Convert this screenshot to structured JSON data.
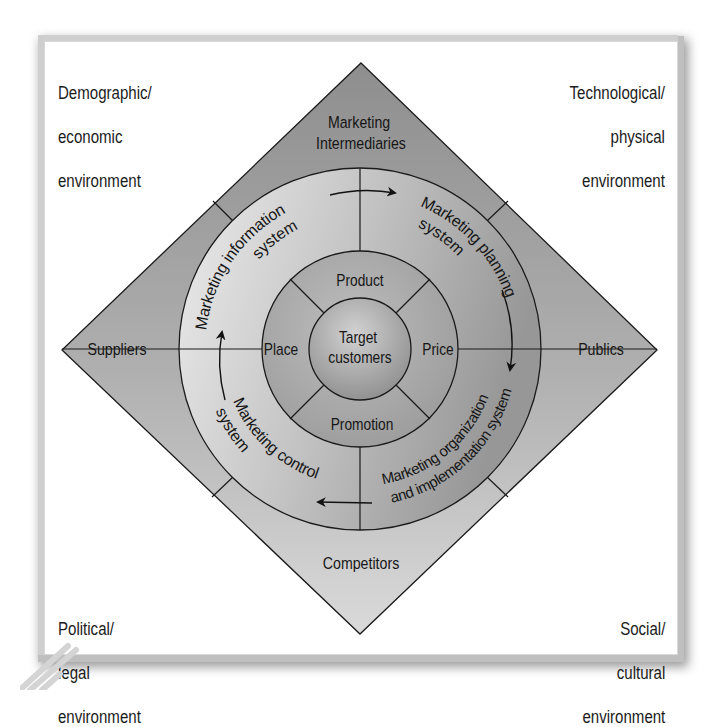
{
  "environments": {
    "top_left": [
      "Demographic/",
      "economic",
      "environment"
    ],
    "top_right": [
      "Technological/",
      "physical",
      "environment"
    ],
    "bottom_left": [
      "Political/",
      "legal",
      "environment"
    ],
    "bottom_right": [
      "Social/",
      "cultural",
      "environment"
    ]
  },
  "actors": {
    "top": [
      "Marketing",
      "Intermediaries"
    ],
    "left": "Suppliers",
    "right": "Publics",
    "bottom": "Competitors"
  },
  "systems": {
    "top_left": [
      "Marketing information",
      "system"
    ],
    "top_right": [
      "Marketing planning",
      "system"
    ],
    "bottom_right": [
      "Marketing organization",
      "and implementation system"
    ],
    "bottom_left": [
      "Marketing control",
      "system"
    ]
  },
  "marketing_mix": {
    "top": "Product",
    "right": "Price",
    "bottom": "Promotion",
    "left": "Place"
  },
  "center": [
    "Target",
    "customers"
  ],
  "colors": {
    "diamond_top": "#8f8f8f",
    "diamond_bottom": "#d6d6d6",
    "ring_light": "#e6e6e6",
    "ring_dark": "#9c9c9c",
    "mix_fill": "#a8a8a8",
    "center_fill": "#b5b5b5",
    "line": "#1a1a1a"
  }
}
